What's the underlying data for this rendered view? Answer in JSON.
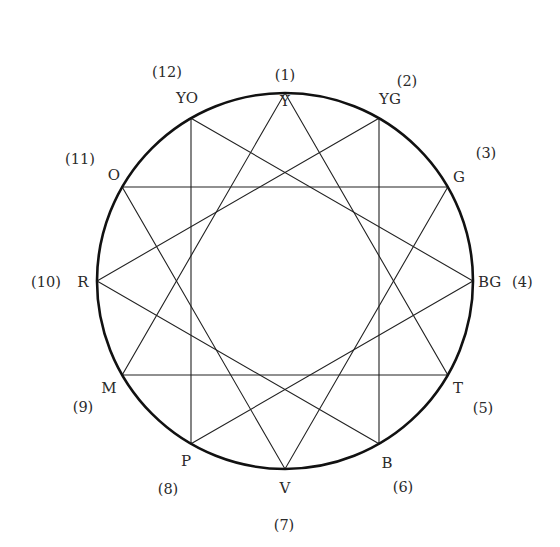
{
  "diagram": {
    "type": "twelve-point color circle with four inscribed triangles",
    "center": [
      285,
      281
    ],
    "radius": 188,
    "colors": {
      "background": "#ffffff",
      "circle_stroke": "#111111",
      "line_stroke": "#222222",
      "text": "#2a2a2a"
    },
    "points": [
      {
        "index": 1,
        "index_label": "(1)",
        "label": "Y",
        "angle_deg": 0,
        "label_xy": [
          285,
          106
        ],
        "index_xy": [
          285,
          80
        ],
        "label_anchor": "middle",
        "index_anchor": "middle"
      },
      {
        "index": 2,
        "index_label": "(2)",
        "label": "YG",
        "angle_deg": 30,
        "label_xy": [
          390,
          104
        ],
        "index_xy": [
          407,
          86
        ],
        "label_anchor": "middle",
        "index_anchor": "middle"
      },
      {
        "index": 3,
        "index_label": "(3)",
        "label": "G",
        "angle_deg": 60,
        "label_xy": [
          459,
          182
        ],
        "index_xy": [
          486,
          158
        ],
        "label_anchor": "middle",
        "index_anchor": "middle"
      },
      {
        "index": 4,
        "index_label": "(4)",
        "label": "BG",
        "angle_deg": 90,
        "label_xy": [
          478,
          287
        ],
        "index_xy": [
          512,
          287
        ],
        "label_anchor": "start",
        "index_anchor": "start"
      },
      {
        "index": 5,
        "index_label": "(5)",
        "label": "T",
        "angle_deg": 120,
        "label_xy": [
          458,
          393
        ],
        "index_xy": [
          483,
          413
        ],
        "label_anchor": "middle",
        "index_anchor": "middle"
      },
      {
        "index": 6,
        "index_label": "(6)",
        "label": "B",
        "angle_deg": 150,
        "label_xy": [
          387,
          468
        ],
        "index_xy": [
          403,
          492
        ],
        "label_anchor": "middle",
        "index_anchor": "middle"
      },
      {
        "index": 7,
        "index_label": "(7)",
        "label": "V",
        "angle_deg": 180,
        "label_xy": [
          285,
          493
        ],
        "index_xy": [
          284,
          530
        ],
        "label_anchor": "middle",
        "index_anchor": "middle"
      },
      {
        "index": 8,
        "index_label": "(8)",
        "label": "P",
        "angle_deg": 210,
        "label_xy": [
          186,
          466
        ],
        "index_xy": [
          168,
          494
        ],
        "label_anchor": "middle",
        "index_anchor": "middle"
      },
      {
        "index": 9,
        "index_label": "(9)",
        "label": "M",
        "angle_deg": 240,
        "label_xy": [
          109,
          393
        ],
        "index_xy": [
          83,
          412
        ],
        "label_anchor": "middle",
        "index_anchor": "middle"
      },
      {
        "index": 10,
        "index_label": "(10)",
        "label": "R",
        "angle_deg": 270,
        "label_xy": [
          83,
          287
        ],
        "index_xy": [
          46,
          287
        ],
        "label_anchor": "middle",
        "index_anchor": "middle"
      },
      {
        "index": 11,
        "index_label": "(11)",
        "label": "O",
        "angle_deg": 300,
        "label_xy": [
          114,
          180
        ],
        "index_xy": [
          80,
          164
        ],
        "label_anchor": "middle",
        "index_anchor": "middle"
      },
      {
        "index": 12,
        "index_label": "(12)",
        "label": "YO",
        "angle_deg": 330,
        "label_xy": [
          187,
          103
        ],
        "index_xy": [
          167,
          77
        ],
        "label_anchor": "middle",
        "index_anchor": "middle"
      }
    ],
    "triangles": [
      {
        "name": "Y-T-M",
        "vertices": [
          1,
          5,
          9
        ]
      },
      {
        "name": "YG-B-R",
        "vertices": [
          2,
          6,
          10
        ]
      },
      {
        "name": "G-V-O",
        "vertices": [
          3,
          7,
          11
        ]
      },
      {
        "name": "BG-P-YO",
        "vertices": [
          4,
          8,
          12
        ]
      }
    ]
  }
}
